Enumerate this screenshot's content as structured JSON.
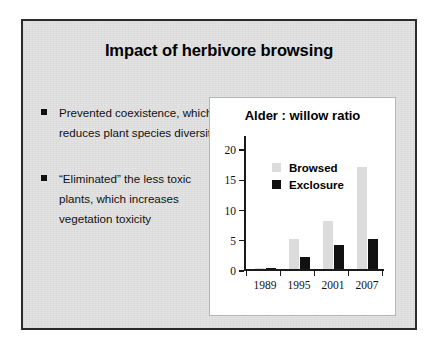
{
  "slide": {
    "title": "Impact of herbivore browsing",
    "bullets": [
      "Prevented coexistence, which reduces plant species diversity",
      "“Eliminated” the less toxic plants, which increases vegetation toxicity"
    ],
    "bullet_marker": "square-bullet-icon",
    "border_color": "#2b2b2b",
    "background_color": "#e2e2e2"
  },
  "chart_data": {
    "type": "bar",
    "title": "Alder : willow ratio",
    "xlabel": "",
    "ylabel": "",
    "categories": [
      "1989",
      "1995",
      "2001",
      "2007"
    ],
    "series": [
      {
        "name": "Browsed",
        "values": [
          0.2,
          5.1,
          8.0,
          17.0
        ],
        "color": "#dcdcdc"
      },
      {
        "name": "Exclosure",
        "values": [
          0.2,
          2.0,
          4.0,
          5.0
        ],
        "color": "#111111"
      }
    ],
    "ylim": [
      0,
      22
    ],
    "yticks": [
      0,
      5,
      10,
      15,
      20
    ],
    "ytick_labels": [
      "0",
      "5",
      "10",
      "15",
      "20"
    ],
    "grid": false,
    "legend_position": "inside-top-left",
    "panel_background": "#ffffff",
    "panel_border_color": "#b5b5b5",
    "axis_color": "#1a1a1a"
  }
}
